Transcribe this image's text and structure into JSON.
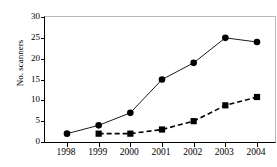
{
  "chart_data": {
    "type": "line",
    "title": "",
    "xlabel": "",
    "ylabel": "No. scanners",
    "categories": [
      "1998",
      "1999",
      "2000",
      "2001",
      "2002",
      "2003",
      "2004"
    ],
    "x": [
      1998,
      1999,
      2000,
      2001,
      2002,
      2003,
      2004
    ],
    "ylim": [
      0,
      30
    ],
    "yticks": [
      0,
      5,
      10,
      15,
      20,
      25,
      30
    ],
    "ytick_labels": [
      "0",
      "5",
      "10",
      "15",
      "20",
      "25",
      "30"
    ],
    "xtick_labels": [
      "1998",
      "1999",
      "2000",
      "2001",
      "2002",
      "2003",
      "2004"
    ],
    "grid": false,
    "legend": null,
    "legend_position": "none",
    "series": [
      {
        "name": "series-circles",
        "marker": "circle",
        "line_style": "solid",
        "color": "#000000",
        "x": [
          1998,
          1999,
          2000,
          2001,
          2002,
          2003,
          2004
        ],
        "values": [
          2,
          4,
          7,
          15,
          19,
          25,
          24
        ]
      },
      {
        "name": "series-squares",
        "marker": "square",
        "line_style": "dashed",
        "color": "#000000",
        "x": [
          1999,
          2000,
          2001,
          2002,
          2003,
          2004
        ],
        "values": [
          2,
          2,
          3,
          5,
          8.8,
          10.8
        ]
      }
    ]
  },
  "axis": {
    "y_title": "No. scanners"
  }
}
